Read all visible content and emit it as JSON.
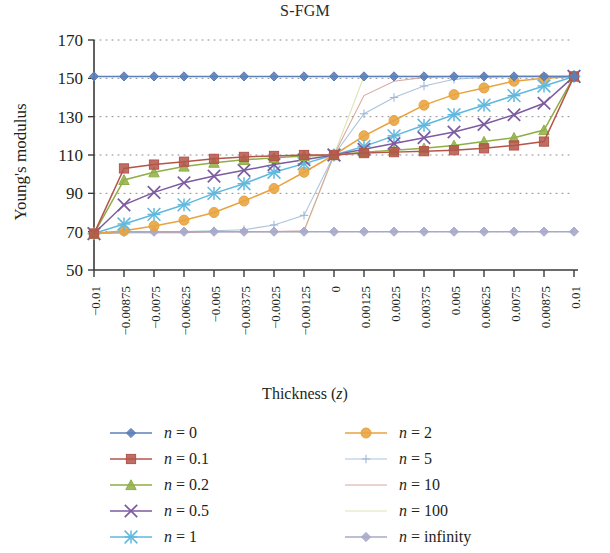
{
  "chart_data": {
    "type": "line",
    "title": "S-FGM",
    "xlabel": "Thickness (z)",
    "ylabel": "Young's modulus",
    "grid": "dotted-horizontal",
    "legend_position": "below-plot-two-columns",
    "xlim": [
      -0.01,
      0.01
    ],
    "ylim": [
      50,
      170
    ],
    "yticks": [
      50,
      70,
      90,
      110,
      130,
      150,
      170
    ],
    "x": [
      -0.01,
      -0.00875,
      -0.0075,
      -0.00625,
      -0.005,
      -0.00375,
      -0.0025,
      -0.00125,
      0,
      0.00125,
      0.0025,
      0.00375,
      0.005,
      0.00625,
      0.0075,
      0.00875,
      0.01
    ],
    "xtick_labels": [
      "−0.01",
      "−0.00875",
      "−0.0075",
      "−0.00625",
      "−0.005",
      "−0.00375",
      "−0.0025",
      "−0.00125",
      "0",
      "0.00125",
      "0.0025",
      "0.00375",
      "0.005",
      "0.00625",
      "0.0075",
      "0.00875",
      "0.01"
    ],
    "series": [
      {
        "name": "n = 0",
        "label": "n = 0",
        "color": "#5b7fb9",
        "marker": "diamond",
        "values": [
          151,
          151,
          151,
          151,
          151,
          151,
          151,
          151,
          151,
          151,
          151,
          151,
          151,
          151,
          151,
          151,
          151
        ]
      },
      {
        "name": "n = 0.1",
        "label": "n = 0.1",
        "color": "#b4554a",
        "marker": "square",
        "values": [
          69,
          103,
          105,
          106.5,
          108,
          109,
          109.5,
          110,
          110,
          111,
          111.5,
          112,
          112.5,
          113.5,
          115,
          117,
          151
        ]
      },
      {
        "name": "n = 0.2",
        "label": "n = 0.2",
        "color": "#8fae45",
        "marker": "triangle",
        "values": [
          69,
          97,
          101,
          104,
          106,
          107.5,
          108.5,
          109.5,
          110,
          111.5,
          112.5,
          113.5,
          115,
          117,
          119,
          123,
          151
        ]
      },
      {
        "name": "n = 0.5",
        "label": "n = 0.5",
        "color": "#7c5ba0",
        "marker": "cross",
        "values": [
          69,
          84,
          90.5,
          95.5,
          99,
          102,
          105,
          107.5,
          110,
          113,
          116,
          119,
          122,
          126,
          131,
          137,
          151
        ]
      },
      {
        "name": "n = 1",
        "label": "n = 1",
        "color": "#61b8dd",
        "marker": "asterisk",
        "values": [
          69,
          74,
          79,
          84,
          90,
          95,
          101,
          105.5,
          110,
          114.5,
          120,
          125.5,
          131,
          136,
          141,
          146,
          151
        ]
      },
      {
        "name": "n = 2",
        "label": "n = 2",
        "color": "#e8a33d",
        "marker": "circle",
        "values": [
          69,
          70.5,
          73,
          76,
          80,
          86,
          92.5,
          101,
          110,
          120,
          128,
          136,
          141.5,
          145,
          148.5,
          150,
          151
        ]
      },
      {
        "name": "n = 5",
        "label": "n = 5",
        "color": "#9eb8d8",
        "marker": "plus",
        "values": [
          69,
          69.5,
          70,
          70,
          70.5,
          71,
          73.5,
          78.5,
          110,
          131.5,
          140,
          146,
          149.5,
          150.5,
          151,
          151,
          151
        ]
      },
      {
        "name": "n = 10",
        "label": "n = 10",
        "color": "#d09a92",
        "marker": "line",
        "values": [
          69,
          69.5,
          69.5,
          69.5,
          70,
          70,
          70,
          70.5,
          110,
          141,
          148.5,
          150.5,
          151,
          151,
          151,
          151,
          151
        ]
      },
      {
        "name": "n = 100",
        "label": "n = 100",
        "color": "#d9dfa5",
        "marker": "line",
        "values": [
          69,
          69.5,
          69.5,
          69.5,
          70,
          70,
          70,
          70,
          110,
          151,
          151,
          151,
          151,
          151,
          151,
          151,
          151
        ]
      },
      {
        "name": "n = infinity",
        "label": "n = infinity",
        "color": "#a8a8ca",
        "marker": "diamond",
        "values": [
          69,
          70,
          70,
          70,
          70,
          70,
          70,
          70,
          70,
          70,
          70,
          70,
          70,
          70,
          70,
          70,
          70
        ]
      }
    ]
  },
  "legend": {
    "items": [
      {
        "label": "n = 0",
        "n": "0"
      },
      {
        "label": "n = 2",
        "n": "2"
      },
      {
        "label": "n = 0.1",
        "n": "0.1"
      },
      {
        "label": "n = 5",
        "n": "5"
      },
      {
        "label": "n = 0.2",
        "n": "0.2"
      },
      {
        "label": "n = 10",
        "n": "10"
      },
      {
        "label": "n = 0.5",
        "n": "0.5"
      },
      {
        "label": "n = 100",
        "n": "100"
      },
      {
        "label": "n = 1",
        "n": "1"
      },
      {
        "label": "n = infinity",
        "n": "infinity"
      }
    ]
  }
}
